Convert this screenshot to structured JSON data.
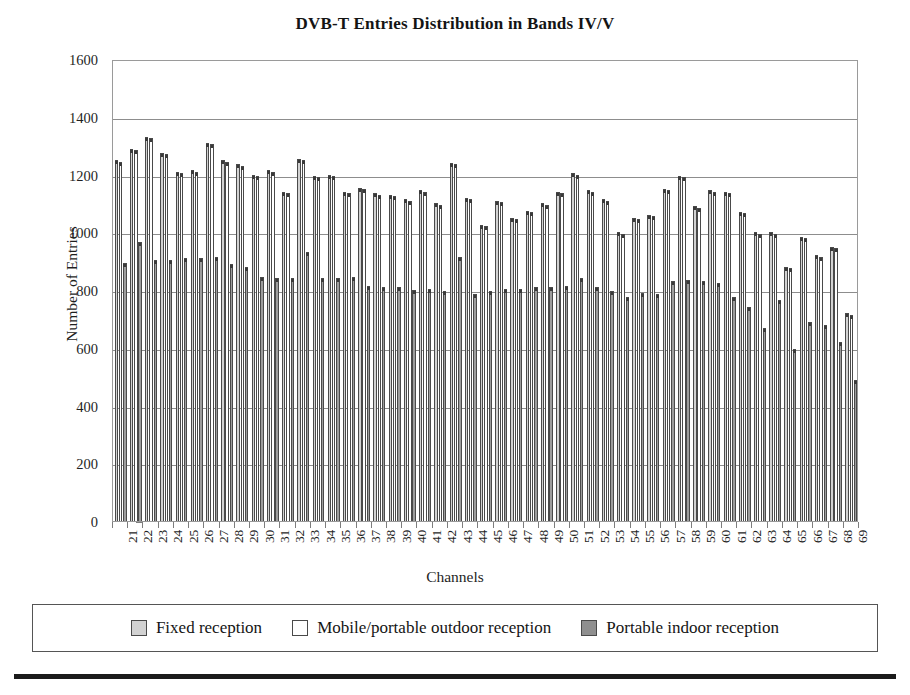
{
  "chart_data": {
    "type": "bar",
    "title": "DVB-T Entries Distribution in Bands IV/V",
    "xlabel": "Channels",
    "ylabel": "Number of Entries",
    "ylim": [
      0,
      1600
    ],
    "ytick_step": 200,
    "yticks": [
      0,
      200,
      400,
      600,
      800,
      1000,
      1200,
      1400,
      1600
    ],
    "grid": true,
    "legend_position": "bottom",
    "categories": [
      "21",
      "22",
      "23",
      "24",
      "25",
      "26",
      "27",
      "28",
      "29",
      "30",
      "31",
      "32",
      "33",
      "34",
      "35",
      "36",
      "37",
      "38",
      "39",
      "40",
      "41",
      "42",
      "43",
      "44",
      "45",
      "46",
      "47",
      "48",
      "49",
      "50",
      "51",
      "52",
      "53",
      "54",
      "55",
      "56",
      "57",
      "58",
      "59",
      "60",
      "61",
      "62",
      "63",
      "64",
      "65",
      "66",
      "67",
      "68",
      "69"
    ],
    "series": [
      {
        "name": "Fixed reception",
        "color": "#d2d2d2",
        "values": [
          1250,
          1290,
          1330,
          1275,
          1210,
          1215,
          1310,
          1250,
          1235,
          1200,
          1215,
          1140,
          1255,
          1195,
          1200,
          1140,
          1155,
          1135,
          1130,
          1115,
          1145,
          1100,
          1240,
          1120,
          1025,
          1110,
          1050,
          1075,
          1100,
          1140,
          1205,
          1145,
          1115,
          1000,
          1050,
          1060,
          1150,
          1195,
          1090,
          1145,
          1140,
          1070,
          1000,
          1000,
          880,
          985,
          920,
          950,
          720
        ]
      },
      {
        "name": "Mobile/portable outdoor reception",
        "color": "#ffffff",
        "values": [
          1245,
          1285,
          1325,
          1270,
          1205,
          1210,
          1305,
          1245,
          1230,
          1195,
          1210,
          1135,
          1250,
          1190,
          1195,
          1135,
          1150,
          1130,
          1125,
          1110,
          1140,
          1095,
          1235,
          1115,
          1020,
          1105,
          1045,
          1070,
          1095,
          1135,
          1200,
          1140,
          1110,
          995,
          1045,
          1055,
          1145,
          1190,
          1085,
          1140,
          1135,
          1065,
          995,
          995,
          875,
          980,
          915,
          945,
          715
        ]
      },
      {
        "name": "Portable indoor reception",
        "color": "#9d9d9d",
        "values": [
          895,
          965,
          905,
          905,
          910,
          910,
          915,
          890,
          880,
          845,
          840,
          840,
          930,
          840,
          840,
          845,
          815,
          810,
          810,
          800,
          805,
          795,
          915,
          785,
          795,
          805,
          805,
          810,
          810,
          815,
          840,
          810,
          795,
          775,
          790,
          785,
          830,
          835,
          830,
          825,
          775,
          740,
          670,
          765,
          595,
          690,
          680,
          620,
          490
        ]
      }
    ]
  },
  "legend": {
    "items": [
      {
        "label": "Fixed reception",
        "swatch": "fixed"
      },
      {
        "label": "Mobile/portable outdoor reception",
        "swatch": "mobile"
      },
      {
        "label": "Portable indoor reception",
        "swatch": "indoor"
      }
    ]
  }
}
